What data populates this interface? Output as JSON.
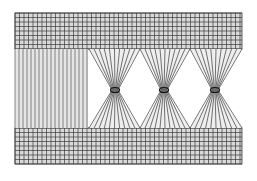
{
  "figure": {
    "colors": {
      "background": "#ffffff",
      "line": "#3a3a3a",
      "fill": "#d9d9d9"
    },
    "regions": {
      "top_band": {
        "x": 15,
        "y": 13,
        "w": 227,
        "h": 36,
        "cell": 4.5
      },
      "bottom_band": {
        "x": 15,
        "y": 128,
        "w": 227,
        "h": 36,
        "cell": 4.5
      },
      "left_panel": {
        "x": 15,
        "y": 49,
        "w": 73,
        "h": 79,
        "spacing": 4
      },
      "bowties": [
        {
          "cx": 115,
          "cy": 90,
          "x0": 89,
          "x1": 140
        },
        {
          "cx": 164,
          "cy": 90,
          "x0": 140,
          "x1": 190
        },
        {
          "cx": 215,
          "cy": 90,
          "x0": 190,
          "x1": 242
        }
      ],
      "fan_lines": 10
    }
  }
}
